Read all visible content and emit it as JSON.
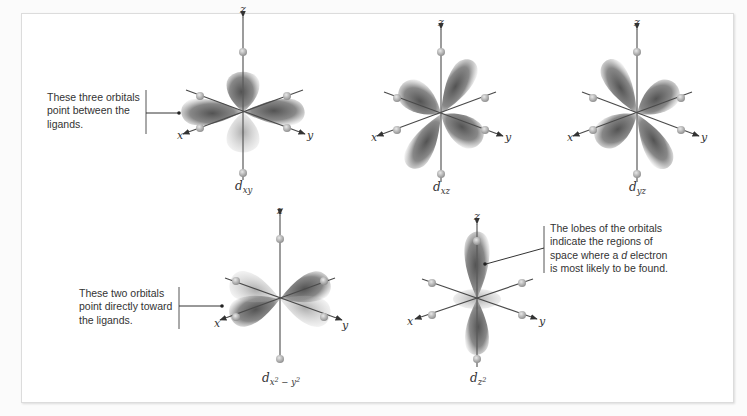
{
  "figure": {
    "background": "#ffffff",
    "lobe_color": "#5a5a5a",
    "axis_color": "#4a4a4a",
    "ligand_color": "#9a9a9a"
  },
  "axes": {
    "x": "x",
    "y": "y",
    "z": "z"
  },
  "orbitals": [
    {
      "id": "dxy",
      "letter": "d",
      "sub": "xy",
      "group": "between-ligands"
    },
    {
      "id": "dxz",
      "letter": "d",
      "sub": "xz",
      "group": "between-ligands"
    },
    {
      "id": "dyz",
      "letter": "d",
      "sub": "yz",
      "group": "between-ligands"
    },
    {
      "id": "dx2y2",
      "letter": "d",
      "sub_x": "x",
      "sub_sup1": "2",
      "sub_minus": " − ",
      "sub_y": "y",
      "sub_sup2": "2",
      "group": "toward-ligands"
    },
    {
      "id": "dz2",
      "letter": "d",
      "sub": "z",
      "sup": "2",
      "group": "toward-ligands"
    }
  ],
  "callouts": {
    "between": {
      "lines": [
        "These three orbitals",
        "point between the",
        "ligands."
      ]
    },
    "toward": {
      "lines": [
        "These two orbitals",
        "point directly toward",
        "the ligands."
      ]
    },
    "lobes": {
      "line1": "The lobes of the orbitals",
      "line2": "indicate the regions of",
      "line3_pre": "space where a ",
      "line3_em": "d",
      "line3_post": " electron",
      "line4": "is most likely to be found."
    }
  }
}
